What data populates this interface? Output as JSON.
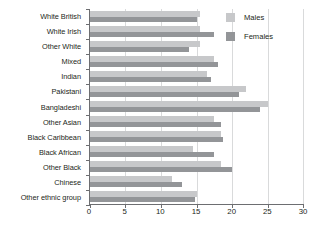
{
  "chart_data": {
    "type": "bar",
    "orientation": "horizontal",
    "title": "",
    "xlabel": "",
    "ylabel": "",
    "xlim": [
      0,
      30
    ],
    "xticks": [
      "0",
      "5",
      "10",
      "15",
      "20",
      "25",
      "30"
    ],
    "grid": true,
    "legend_position": "top-right",
    "categories": [
      "White British",
      "White Irish",
      "Other White",
      "Mixed",
      "Indian",
      "Pakistani",
      "Bangladeshi",
      "Other Asian",
      "Black Caribbean",
      "Black African",
      "Other Black",
      "Chinese",
      "Other ethnic group"
    ],
    "series": [
      {
        "name": "Males",
        "color": "#c7c8ca",
        "values": [
          15.5,
          15.5,
          15.5,
          17.5,
          16.5,
          22.0,
          25.0,
          17.5,
          18.5,
          14.5,
          18.5,
          11.5,
          15.0
        ]
      },
      {
        "name": "Females",
        "color": "#939598",
        "values": [
          15.0,
          17.5,
          14.0,
          18.0,
          17.0,
          21.0,
          24.0,
          18.5,
          18.8,
          17.5,
          20.0,
          13.0,
          14.8
        ]
      }
    ]
  }
}
